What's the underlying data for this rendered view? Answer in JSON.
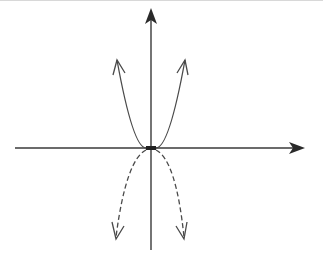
{
  "diagram": {
    "type": "coordinate-axes-with-parabolas",
    "colors": {
      "axis": "#3a3a3a",
      "curve": "#4a4a4a",
      "background": "#ffffff",
      "top_rule": "#d8d8d8"
    },
    "axes": {
      "x_axis": {
        "label": "",
        "arrow": "filled-right"
      },
      "y_axis": {
        "label": "",
        "arrow": "filled-up"
      },
      "origin": {
        "marker": "dot"
      }
    },
    "curves": [
      {
        "name": "upward-parabola",
        "style": "solid",
        "opens": "up",
        "arrowheads": "open",
        "vertex": "origin"
      },
      {
        "name": "downward-parabola",
        "style": "dashed",
        "opens": "down",
        "arrowheads": "open",
        "vertex": "origin"
      }
    ]
  }
}
